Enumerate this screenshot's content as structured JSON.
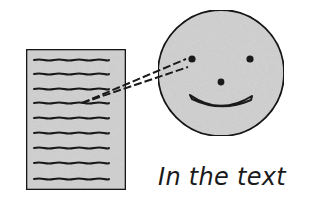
{
  "diagram": {
    "caption": "In the text",
    "page": {
      "x": 26,
      "y": 49,
      "width": 100,
      "height": 141,
      "fill": "#d4d4d4",
      "stroke": "#1a1a1a",
      "line_count": 9,
      "line_ys": [
        60,
        74,
        89,
        103,
        118,
        133,
        148,
        163,
        179
      ]
    },
    "face": {
      "cx": 221,
      "cy": 73,
      "r": 64,
      "fill": "#d4d4d4",
      "stroke": "#1a1a1a",
      "features": [
        "left-eye",
        "right-eye",
        "nose",
        "smile"
      ]
    },
    "gaze": {
      "style": "dashed",
      "from": "left-eye",
      "to": "text-line-4"
    }
  }
}
